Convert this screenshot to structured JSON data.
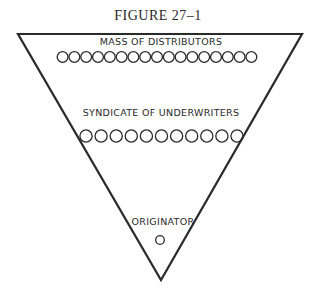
{
  "figure": {
    "title": "FIGURE 27–1",
    "shape": "inverted-triangle",
    "stroke_color": "#2a2a2a",
    "background_color": "#ffffff",
    "tiers": [
      {
        "label": "MASS OF DISTRIBUTORS",
        "circle_count": 17
      },
      {
        "label": "SYNDICATE OF UNDERWRITERS",
        "circle_count": 11
      },
      {
        "label": "ORIGINATOR",
        "circle_count": 1
      }
    ]
  }
}
